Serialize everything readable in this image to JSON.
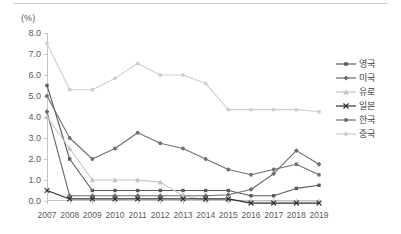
{
  "figure": {
    "unit_label": "(%)"
  },
  "legend": {
    "position": "right",
    "items": [
      {
        "label": "영국",
        "color": "#5a5a5a",
        "marker": "square"
      },
      {
        "label": "미국",
        "color": "#6b6b6b",
        "marker": "diamond"
      },
      {
        "label": "유로",
        "color": "#c4c4c4",
        "marker": "triangle"
      },
      {
        "label": "일본",
        "color": "#2e2e2e",
        "marker": "x"
      },
      {
        "label": "한국",
        "color": "#707070",
        "marker": "circle"
      },
      {
        "label": "중국",
        "color": "#cfcfcf",
        "marker": "circle"
      }
    ]
  },
  "chart_data": {
    "type": "line",
    "title": "",
    "xlabel": "",
    "ylabel": "(%)",
    "ylim": [
      0.0,
      8.0
    ],
    "yticks": [
      "0.0",
      "1.0",
      "2.0",
      "3.0",
      "4.0",
      "5.0",
      "6.0",
      "7.0",
      "8.0"
    ],
    "ytick_values": [
      0.0,
      1.0,
      2.0,
      3.0,
      4.0,
      5.0,
      6.0,
      7.0,
      8.0
    ],
    "grid": false,
    "categories": [
      "2007",
      "2008",
      "2009",
      "2010",
      "2011",
      "2012",
      "2013",
      "2014",
      "2015",
      "2016",
      "2017",
      "2018",
      "2019"
    ],
    "series": [
      {
        "name": "영국",
        "color": "#5a5a5a",
        "marker": "square",
        "values": [
          5.5,
          2.0,
          0.5,
          0.5,
          0.5,
          0.5,
          0.5,
          0.5,
          0.5,
          0.25,
          0.25,
          0.6,
          0.75
        ]
      },
      {
        "name": "미국",
        "color": "#6b6b6b",
        "marker": "diamond",
        "values": [
          4.25,
          0.25,
          0.25,
          0.25,
          0.25,
          0.25,
          0.25,
          0.25,
          0.3,
          0.55,
          1.3,
          2.4,
          1.75
        ]
      },
      {
        "name": "유로",
        "color": "#c4c4c4",
        "marker": "triangle",
        "values": [
          4.0,
          2.5,
          1.0,
          1.0,
          1.0,
          0.9,
          0.25,
          0.05,
          0.05,
          0.0,
          0.0,
          0.0,
          0.0
        ]
      },
      {
        "name": "일본",
        "color": "#2e2e2e",
        "marker": "x",
        "values": [
          0.5,
          0.1,
          0.1,
          0.1,
          0.1,
          0.1,
          0.1,
          0.1,
          0.1,
          -0.1,
          -0.1,
          -0.1,
          -0.1
        ]
      },
      {
        "name": "한국",
        "color": "#707070",
        "marker": "circle",
        "values": [
          5.0,
          3.0,
          2.0,
          2.5,
          3.25,
          2.75,
          2.5,
          2.0,
          1.5,
          1.25,
          1.5,
          1.75,
          1.25
        ]
      },
      {
        "name": "중국",
        "color": "#cfcfcf",
        "marker": "circle",
        "values": [
          7.5,
          5.3,
          5.3,
          5.85,
          6.55,
          6.0,
          6.0,
          5.6,
          4.35,
          4.35,
          4.35,
          4.35,
          4.25
        ]
      }
    ]
  }
}
